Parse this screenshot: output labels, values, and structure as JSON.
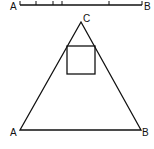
{
  "segment": {
    "label_start": "A",
    "label_end": "B",
    "ticks_x": [
      20,
      36,
      53,
      62,
      109,
      142
    ]
  },
  "triangle": {
    "label_apex": "C",
    "label_left": "A",
    "label_right": "B"
  },
  "colors": {
    "stroke": "#111111",
    "background": "#ffffff"
  }
}
